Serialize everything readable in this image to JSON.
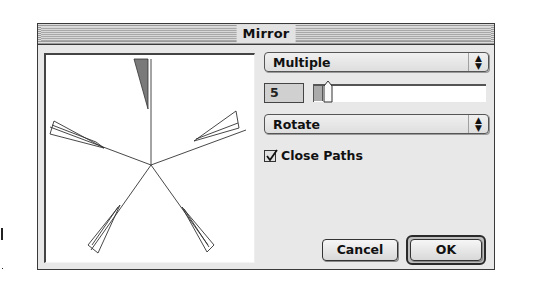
{
  "dialog": {
    "title": "Mirror",
    "mode_popup": {
      "selected": "Multiple"
    },
    "count": {
      "value": "5",
      "slider_position_pct": 5
    },
    "transform_popup": {
      "selected": "Rotate"
    },
    "close_paths": {
      "label": "Close Paths",
      "checked": true
    },
    "buttons": {
      "cancel": "Cancel",
      "ok": "OK"
    },
    "preview": {
      "description": "Five-fold rotational mirror preview of a wedge shape",
      "copies": 5
    }
  },
  "icons": {
    "popup_arrows": "up-down-arrows-icon",
    "checkmark": "checkmark-icon"
  },
  "colors": {
    "dialog_bg": "#e8e8e8",
    "preview_bg": "#ffffff",
    "wedge_fill": "#7a7a7a",
    "border": "#3a3a3a"
  }
}
